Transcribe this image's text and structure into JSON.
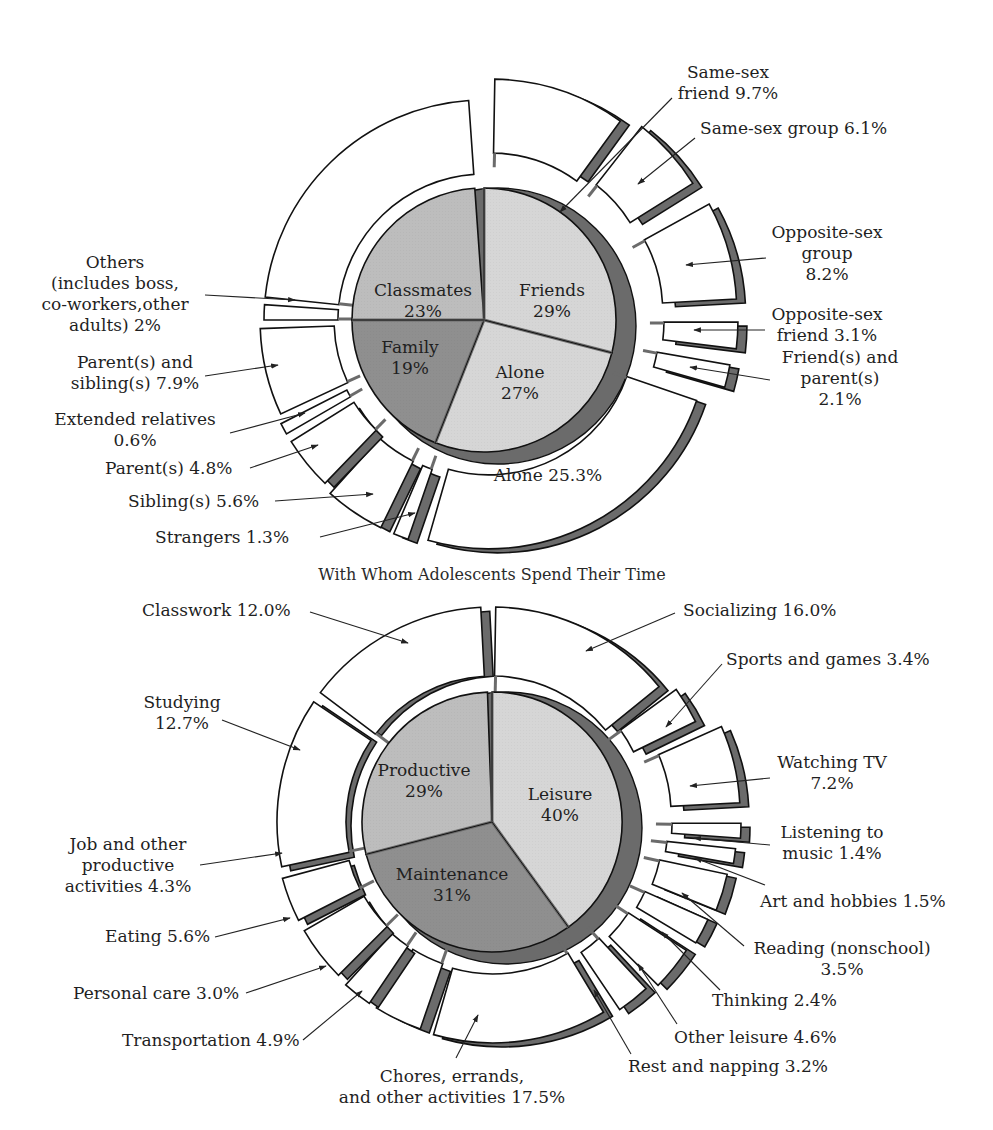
{
  "colors": {
    "outer_fill": "#ffffff",
    "side_band": "#6b6b6b",
    "inner_light": "#d6d6d6",
    "inner_mid": "#bdbdbd",
    "inner_dark": "#8f8f8f",
    "stroke": "#111111"
  },
  "chart_data": [
    {
      "type": "pie",
      "subtype": "nested-exploded-pie",
      "title": "With Whom Adolescents Spend Their Time",
      "center": [
        484,
        320
      ],
      "inner_radius": 132,
      "ring_inner": 150,
      "ring_outer": 220,
      "inner": [
        {
          "name": "Friends",
          "value": 29,
          "label": "29%",
          "fill": "inner_light",
          "start": 0,
          "end": 104.4,
          "lx": 552,
          "ly": 296
        },
        {
          "name": "Alone",
          "value": 27,
          "label": "27%",
          "fill": "inner_light",
          "start": 104.4,
          "end": 201.6,
          "lx": 520,
          "ly": 378
        },
        {
          "name": "Family",
          "value": 19,
          "label": "19%",
          "fill": "inner_dark",
          "start": 201.6,
          "end": 270,
          "lx": 410,
          "ly": 353
        },
        {
          "name": "Classmates",
          "value": 23,
          "label": "23%",
          "fill": "inner_mid",
          "start": 270,
          "end": 356,
          "lx": 423,
          "ly": 296
        }
      ],
      "outer": [
        {
          "name": "Same-sex friend",
          "value": 9.7,
          "start": 1,
          "end": 36,
          "explode": 22,
          "side": true
        },
        {
          "name": "Same-sex group",
          "value": 6.1,
          "start": 38,
          "end": 58,
          "explode": 30,
          "side": true
        },
        {
          "name": "Opposite-sex group",
          "value": 8.2,
          "start": 61,
          "end": 87,
          "explode": 34,
          "side": true
        },
        {
          "name": "Opposite-sex friend",
          "value": 3.1,
          "start": 90,
          "end": 97,
          "explode": 34,
          "side": true
        },
        {
          "name": "Friend(s) and parent(s)",
          "value": 2.1,
          "start": 100,
          "end": 106,
          "explode": 30,
          "side": true
        },
        {
          "name": "Alone",
          "value": 25.3,
          "start": 109,
          "end": 196,
          "explode": 10,
          "side": true
        },
        {
          "name": "Strangers",
          "value": 1.3,
          "start": 199,
          "end": 203,
          "explode": 12,
          "side": true
        },
        {
          "name": "Sibling(s)",
          "value": 5.6,
          "start": 206,
          "end": 222,
          "explode": 12,
          "side": true
        },
        {
          "name": "Parent(s)",
          "value": 4.8,
          "start": 224,
          "end": 238,
          "explode": 8,
          "side": true
        },
        {
          "name": "Extended relatives",
          "value": 0.6,
          "start": 240,
          "end": 243,
          "explode": 8,
          "side": false
        },
        {
          "name": "Parent(s) and sibling(s)",
          "value": 7.9,
          "start": 245,
          "end": 268,
          "explode": 4,
          "side": false
        },
        {
          "name": "Others (includes boss, co-workers, other adults)",
          "value": 2,
          "start": 270,
          "end": 274,
          "explode": 0,
          "side": false
        },
        {
          "name": "Classmates (outer)",
          "value": 23,
          "start": 276,
          "end": 356,
          "explode": 0,
          "side": false
        }
      ],
      "labels": [
        {
          "lines": [
            "Same-sex",
            "friend 9.7%"
          ],
          "x": 728,
          "y": 78,
          "anchor": "middle",
          "ax": [
            672,
            98
          ],
          "ap": [
            560,
            212
          ]
        },
        {
          "lines": [
            "Same-sex group 6.1%"
          ],
          "x": 700,
          "y": 134,
          "anchor": "start",
          "ax": [
            695,
            138
          ],
          "ap": [
            638,
            184
          ]
        },
        {
          "lines": [
            "Opposite-sex",
            "group",
            "8.2%"
          ],
          "x": 827,
          "y": 238,
          "anchor": "middle",
          "ax": [
            766,
            258
          ],
          "ap": [
            686,
            265
          ]
        },
        {
          "lines": [
            "Opposite-sex",
            "friend 3.1%"
          ],
          "x": 827,
          "y": 320,
          "anchor": "middle",
          "ax": [
            765,
            330
          ],
          "ap": [
            694,
            330
          ]
        },
        {
          "lines": [
            "Friend(s) and",
            "parent(s)",
            "2.1%"
          ],
          "x": 840,
          "y": 363,
          "anchor": "middle",
          "ax": [
            770,
            380
          ],
          "ap": [
            690,
            367
          ]
        },
        {
          "lines": [
            "Alone 25.3%"
          ],
          "x": 548,
          "y": 481,
          "anchor": "middle",
          "ax": null,
          "ap": null
        },
        {
          "lines": [
            "Strangers 1.3%"
          ],
          "x": 155,
          "y": 543,
          "anchor": "start",
          "ax": [
            320,
            537
          ],
          "ap": [
            415,
            513
          ]
        },
        {
          "lines": [
            "Sibling(s) 5.6%"
          ],
          "x": 128,
          "y": 507,
          "anchor": "start",
          "ax": [
            275,
            501
          ],
          "ap": [
            373,
            494
          ]
        },
        {
          "lines": [
            "Parent(s) 4.8%"
          ],
          "x": 105,
          "y": 474,
          "anchor": "start",
          "ax": [
            250,
            468
          ],
          "ap": [
            318,
            445
          ]
        },
        {
          "lines": [
            "Extended relatives",
            "0.6%"
          ],
          "x": 135,
          "y": 425,
          "anchor": "middle",
          "ax": [
            230,
            433
          ],
          "ap": [
            305,
            413
          ]
        },
        {
          "lines": [
            "Parent(s) and",
            "sibling(s) 7.9%"
          ],
          "x": 135,
          "y": 368,
          "anchor": "middle",
          "ax": [
            205,
            376
          ],
          "ap": [
            278,
            365
          ]
        },
        {
          "lines": [
            "Others",
            "(includes boss,",
            "co-workers,other",
            "adults) 2%"
          ],
          "x": 115,
          "y": 268,
          "anchor": "middle",
          "ax": [
            205,
            295
          ],
          "ap": [
            295,
            300
          ]
        }
      ]
    },
    {
      "type": "pie",
      "subtype": "nested-exploded-pie",
      "title": "",
      "center": [
        492,
        822
      ],
      "inner_radius": 130,
      "ring_inner": 150,
      "ring_outer": 215,
      "inner": [
        {
          "name": "Leisure",
          "value": 40,
          "label": "40%",
          "fill": "inner_light",
          "start": 0,
          "end": 144,
          "lx": 560,
          "ly": 800
        },
        {
          "name": "Maintenance",
          "value": 31,
          "label": "31%",
          "fill": "inner_dark",
          "start": 144,
          "end": 255.6,
          "lx": 452,
          "ly": 880
        },
        {
          "name": "Productive",
          "value": 29,
          "label": "29%",
          "fill": "inner_mid",
          "start": 255.6,
          "end": 358,
          "lx": 424,
          "ly": 776
        }
      ],
      "outer": [
        {
          "name": "Socializing",
          "value": 16.0,
          "start": 1,
          "end": 51,
          "explode": 0,
          "side": true
        },
        {
          "name": "Sports and games",
          "value": 3.4,
          "start": 54,
          "end": 64,
          "explode": 12,
          "side": true
        },
        {
          "name": "Watching TV",
          "value": 7.2,
          "start": 66,
          "end": 87,
          "explode": 34,
          "side": true
        },
        {
          "name": "Listening to music",
          "value": 1.4,
          "start": 90,
          "end": 94,
          "explode": 34,
          "side": true
        },
        {
          "name": "Art and hobbies",
          "value": 1.5,
          "start": 96,
          "end": 100,
          "explode": 30,
          "side": true
        },
        {
          "name": "Reading (nonschool)",
          "value": 3.5,
          "start": 102,
          "end": 112,
          "explode": 26,
          "side": true
        },
        {
          "name": "Thinking",
          "value": 2.4,
          "start": 114,
          "end": 121,
          "explode": 22,
          "side": true
        },
        {
          "name": "Other leisure",
          "value": 4.6,
          "start": 123,
          "end": 135,
          "explode": 18,
          "side": true
        },
        {
          "name": "Rest and napping",
          "value": 3.2,
          "start": 137,
          "end": 146,
          "explode": 12,
          "side": true
        },
        {
          "name": "Chores, errands, and other activities",
          "value": 17.5,
          "start": 149,
          "end": 196,
          "explode": 6,
          "side": true
        },
        {
          "name": "Transportation",
          "value": 4.9,
          "start": 199,
          "end": 212,
          "explode": 4,
          "side": true
        },
        {
          "name": "Personal care",
          "value": 3.0,
          "start": 214,
          "end": 222,
          "explode": 4,
          "side": true
        },
        {
          "name": "Eating",
          "value": 5.6,
          "start": 225,
          "end": 240,
          "explode": 2,
          "side": true
        },
        {
          "name": "Job and other productive activities",
          "value": 4.3,
          "start": 243,
          "end": 255,
          "explode": 2,
          "side": true
        },
        {
          "name": "Studying",
          "value": 12.7,
          "start": 258,
          "end": 304,
          "explode": 0,
          "side": true
        },
        {
          "name": "Classwork",
          "value": 12.0,
          "start": 307,
          "end": 357,
          "explode": 0,
          "side": true
        }
      ],
      "labels": [
        {
          "lines": [
            "Socializing 16.0%"
          ],
          "x": 683,
          "y": 616,
          "anchor": "start",
          "ax": [
            675,
            613
          ],
          "ap": [
            586,
            651
          ]
        },
        {
          "lines": [
            "Sports and games 3.4%"
          ],
          "x": 726,
          "y": 665,
          "anchor": "start",
          "ax": [
            722,
            664
          ],
          "ap": [
            666,
            727
          ]
        },
        {
          "lines": [
            "Watching TV",
            "7.2%"
          ],
          "x": 832,
          "y": 768,
          "anchor": "middle",
          "ax": [
            770,
            778
          ],
          "ap": [
            690,
            786
          ]
        },
        {
          "lines": [
            "Listening to",
            "music 1.4%"
          ],
          "x": 832,
          "y": 838,
          "anchor": "middle",
          "ax": [
            770,
            845
          ],
          "ap": [
            694,
            838
          ]
        },
        {
          "lines": [
            "Art and hobbies 1.5%"
          ],
          "x": 760,
          "y": 907,
          "anchor": "start",
          "ax": [
            765,
            885
          ],
          "ap": [
            695,
            858
          ]
        },
        {
          "lines": [
            "Reading (nonschool)",
            "3.5%"
          ],
          "x": 842,
          "y": 954,
          "anchor": "middle",
          "ax": [
            744,
            946
          ],
          "ap": [
            682,
            893
          ]
        },
        {
          "lines": [
            "Thinking 2.4%"
          ],
          "x": 712,
          "y": 1006,
          "anchor": "start",
          "ax": [
            720,
            990
          ],
          "ap": [
            662,
            932
          ]
        },
        {
          "lines": [
            "Other leisure 4.6%"
          ],
          "x": 674,
          "y": 1043,
          "anchor": "start",
          "ax": [
            677,
            1024
          ],
          "ap": [
            638,
            964
          ]
        },
        {
          "lines": [
            "Rest and napping 3.2%"
          ],
          "x": 628,
          "y": 1072,
          "anchor": "start",
          "ax": [
            631,
            1054
          ],
          "ap": [
            594,
            990
          ]
        },
        {
          "lines": [
            "Chores, errands,",
            "and other activities 17.5%"
          ],
          "x": 452,
          "y": 1082,
          "anchor": "middle",
          "ax": [
            456,
            1058
          ],
          "ap": [
            478,
            1015
          ]
        },
        {
          "lines": [
            "Transportation 4.9%"
          ],
          "x": 122,
          "y": 1046,
          "anchor": "start",
          "ax": [
            303,
            1040
          ],
          "ap": [
            362,
            991
          ]
        },
        {
          "lines": [
            "Personal care 3.0%"
          ],
          "x": 73,
          "y": 999,
          "anchor": "start",
          "ax": [
            246,
            993
          ],
          "ap": [
            326,
            966
          ]
        },
        {
          "lines": [
            "Eating 5.6%"
          ],
          "x": 105,
          "y": 942,
          "anchor": "start",
          "ax": [
            215,
            937
          ],
          "ap": [
            290,
            918
          ]
        },
        {
          "lines": [
            "Job and other",
            "productive",
            "activities 4.3%"
          ],
          "x": 128,
          "y": 850,
          "anchor": "middle",
          "ax": [
            200,
            865
          ],
          "ap": [
            282,
            853
          ]
        },
        {
          "lines": [
            "Studying",
            "12.7%"
          ],
          "x": 182,
          "y": 708,
          "anchor": "middle",
          "ax": [
            222,
            720
          ],
          "ap": [
            300,
            750
          ]
        },
        {
          "lines": [
            "Classwork 12.0%"
          ],
          "x": 142,
          "y": 616,
          "anchor": "start",
          "ax": [
            310,
            612
          ],
          "ap": [
            408,
            643
          ]
        }
      ]
    }
  ],
  "caption": "With Whom Adolescents Spend Their Time"
}
